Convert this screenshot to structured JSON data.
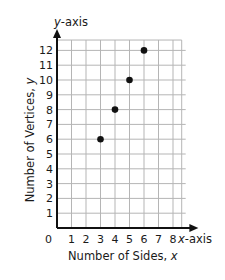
{
  "chart_data": {
    "type": "scatter",
    "title": "",
    "xlabel": "Number of Sides, x",
    "ylabel": "Number of Vertices, y",
    "x_axis_name": "x-axis",
    "y_axis_name": "y-axis",
    "x": [
      3,
      4,
      5,
      6
    ],
    "y": [
      6,
      8,
      10,
      12
    ],
    "xlim": [
      0,
      8
    ],
    "ylim": [
      0,
      12
    ],
    "x_ticks": [
      "1",
      "2",
      "3",
      "4",
      "5",
      "6",
      "7",
      "8"
    ],
    "y_ticks": [
      "1",
      "2",
      "3",
      "4",
      "5",
      "6",
      "7",
      "8",
      "9",
      "10",
      "11",
      "12"
    ],
    "origin_label": "0",
    "grid": true,
    "legend": null,
    "colors": {
      "point": "#111111",
      "grid": "#b5b5b5",
      "axis": "#111111"
    }
  }
}
